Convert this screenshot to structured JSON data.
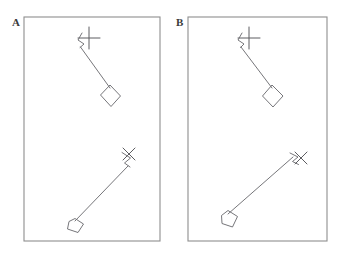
{
  "figure": {
    "background_color": "#ffffff",
    "line_color": "#6f6f73",
    "frame_color": "#8e8e8e",
    "label_color": "#3a3a3a",
    "width": 344,
    "height": 255,
    "panels": [
      {
        "id": "panel-a",
        "label": "A",
        "label_x": 12,
        "label_y": 26,
        "frame": {
          "x": 24,
          "y": 17,
          "width": 136,
          "height": 224
        },
        "objects": [
          {
            "id": "panel-a-upper-assembly",
            "name": "plus-marker-with-arm-and-diamond",
            "marker_type": "plus",
            "marker": {
              "cx": 89,
              "cy": 38,
              "arm": 11
            },
            "zigzag": "82,33 78,40 84,44 80,48",
            "arm_path": "81,47 110,89",
            "quad": "110,85 120,96 111,106 101,95"
          },
          {
            "id": "panel-a-lower-assembly",
            "name": "x-marker-with-arm-and-quad",
            "marker_type": "ex",
            "marker": {
              "cx": 129,
              "cy": 154,
              "arm": 8
            },
            "zigzag": "122,152 130,158 124,163 130,167",
            "arm_path": "127,166 75,222",
            "quad": "75,219 83,224 78,232 68,229 69,222"
          }
        ]
      },
      {
        "id": "panel-b",
        "label": "B",
        "label_x": 176,
        "label_y": 26,
        "frame": {
          "x": 188,
          "y": 17,
          "width": 139,
          "height": 224
        },
        "objects": [
          {
            "id": "panel-b-upper-assembly",
            "name": "plus-marker-with-arm-and-diamond",
            "marker_type": "plus",
            "marker": {
              "cx": 249,
              "cy": 38,
              "arm": 11
            },
            "zigzag": "241,33 238,40 244,44 240,48",
            "arm_path": "241,47 272,89",
            "quad": "272,85 283,96 273,107 263,96"
          },
          {
            "id": "panel-b-lower-assembly",
            "name": "x-marker-with-arm-and-quad",
            "marker_type": "ex",
            "marker": {
              "cx": 301,
              "cy": 158,
              "arm": 8
            },
            "zigzag": "290,152 297,156 292,161 298,164",
            "arm_path": "293,157 227,215",
            "quad": "227,211 237,216 233,227 222,224 221,216"
          }
        ]
      }
    ]
  }
}
